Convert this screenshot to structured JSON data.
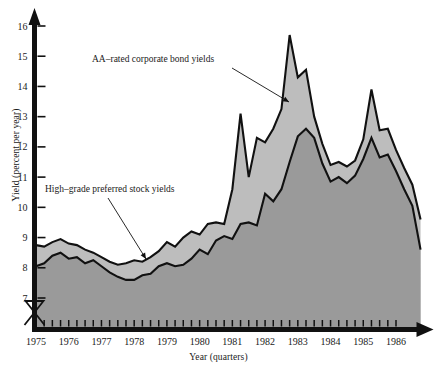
{
  "chart_data": {
    "type": "area",
    "title": "",
    "xlabel": "Year (quarters)",
    "ylabel": "Yield (percent per year)",
    "ylim": [
      6.6,
      16.4
    ],
    "yticks": [
      7,
      8,
      9,
      10,
      11,
      12,
      13,
      14,
      15,
      16
    ],
    "ytick_labels": [
      "7",
      "8",
      "9",
      "10",
      "11",
      "12",
      "13",
      "14",
      "15",
      "16"
    ],
    "xlim": [
      1975.0,
      1987.0
    ],
    "xticks": [
      1975,
      1976,
      1977,
      1978,
      1979,
      1980,
      1981,
      1982,
      1983,
      1984,
      1985,
      1986
    ],
    "xtick_labels": [
      "1975",
      "1976",
      "1977",
      "1978",
      "1979",
      "1980",
      "1981",
      "1982",
      "1983",
      "1984",
      "1985",
      "1986"
    ],
    "minor_tick_interval_quarters": 1,
    "grid": false,
    "legend": "annotations",
    "axis_break_y": true,
    "x": [
      1975.0,
      1975.25,
      1975.5,
      1975.75,
      1976.0,
      1976.25,
      1976.5,
      1976.75,
      1977.0,
      1977.25,
      1977.5,
      1977.75,
      1978.0,
      1978.25,
      1978.5,
      1978.75,
      1979.0,
      1979.25,
      1979.5,
      1979.75,
      1980.0,
      1980.25,
      1980.5,
      1980.75,
      1981.0,
      1981.25,
      1981.5,
      1981.75,
      1982.0,
      1982.25,
      1982.5,
      1982.75,
      1983.0,
      1983.25,
      1983.5,
      1983.75,
      1984.0,
      1984.25,
      1984.5,
      1984.75,
      1985.0,
      1985.25,
      1985.5,
      1985.75,
      1986.0,
      1986.25,
      1986.5,
      1986.75
    ],
    "series": [
      {
        "name": "AA-rated corporate bond yields",
        "color": "#bdbdbd",
        "values": [
          8.75,
          8.7,
          8.85,
          8.95,
          8.8,
          8.75,
          8.6,
          8.5,
          8.35,
          8.2,
          8.1,
          8.15,
          8.25,
          8.2,
          8.35,
          8.55,
          8.85,
          8.7,
          9.0,
          9.2,
          9.1,
          9.45,
          9.5,
          9.45,
          10.6,
          13.1,
          11.0,
          12.3,
          12.15,
          12.6,
          13.25,
          15.7,
          14.3,
          14.55,
          13.0,
          12.1,
          11.4,
          11.5,
          11.35,
          11.55,
          12.25,
          13.9,
          12.55,
          12.6,
          11.9,
          11.3,
          10.75,
          9.6
        ]
      },
      {
        "name": "High-grade preferred stock yields",
        "color": "#9a9a9a",
        "values": [
          8.05,
          8.15,
          8.4,
          8.5,
          8.3,
          8.35,
          8.15,
          8.25,
          8.05,
          7.85,
          7.7,
          7.6,
          7.6,
          7.75,
          7.8,
          8.05,
          8.15,
          8.05,
          8.1,
          8.3,
          8.6,
          8.45,
          8.9,
          9.05,
          8.95,
          9.45,
          9.5,
          9.4,
          10.45,
          10.2,
          10.6,
          11.5,
          12.35,
          12.6,
          12.3,
          11.45,
          10.85,
          11.0,
          10.8,
          11.05,
          11.6,
          12.3,
          11.65,
          11.75,
          11.2,
          10.6,
          10.05,
          8.6
        ]
      }
    ],
    "annotations": [
      {
        "text": "AA–rated corporate bond yields",
        "text_x": 92,
        "text_y": 62,
        "leader_from": [
          232,
          68
        ],
        "leader_to": [
          289,
          102
        ]
      },
      {
        "text": "High–grade preferred stock yields",
        "text_x": 45,
        "text_y": 192,
        "leader_from": [
          108,
          198
        ],
        "leader_to": [
          146,
          259
        ]
      }
    ]
  },
  "axis": {
    "y_title": "Yield (percent per year)",
    "x_title": "Year (quarters)"
  },
  "colors": {
    "band_upper": "#bdbdbd",
    "band_lower": "#9a9a9a",
    "line": "#111111",
    "axis": "#111111",
    "background": "#ffffff"
  }
}
